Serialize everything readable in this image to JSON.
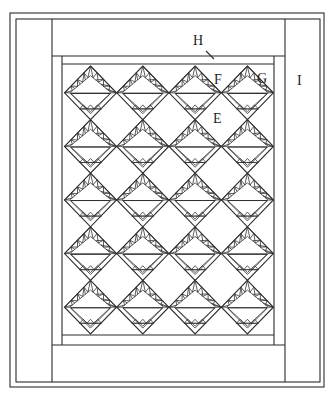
{
  "diagram": {
    "colors": {
      "line": "#2b2b2b",
      "background": "#ffffff"
    },
    "frame": {
      "outer": {
        "x1": 10,
        "y1": 13,
        "x2": 324,
        "y2": 387
      },
      "outer_inner": {
        "x1": 16,
        "y1": 19,
        "x2": 320,
        "y2": 382
      },
      "border_I_left_x": 52,
      "border_I_right_x": 285,
      "border_H_top_bottom_y": 56,
      "border_H_bottom_top_y": 345,
      "inner_frame": {
        "x1": 62,
        "y1": 56,
        "x2": 274,
        "y2": 345
      },
      "block_area": {
        "x1": 62,
        "y1": 64,
        "x2": 274,
        "y2": 335
      }
    },
    "blocks": {
      "name": "basket-block",
      "rows": 5,
      "cols": 4,
      "first_center_x": 90.5,
      "col_spacing": 52.3,
      "first_top_y": 66,
      "row_spacing": 53.6,
      "half_width": 26,
      "half_height": 26.8
    },
    "labels": [
      {
        "id": "H",
        "text": "H",
        "x": 193,
        "y": 34,
        "meaning": "top/bottom border"
      },
      {
        "id": "F",
        "text": "F",
        "x": 214,
        "y": 73,
        "meaning": "setting triangle"
      },
      {
        "id": "G",
        "text": "G",
        "x": 257,
        "y": 72,
        "meaning": "corner triangle"
      },
      {
        "id": "I",
        "text": "I",
        "x": 297,
        "y": 74,
        "meaning": "side border"
      },
      {
        "id": "E",
        "text": "E",
        "x": 213,
        "y": 112,
        "meaning": "setting square"
      }
    ],
    "leader_H": {
      "x1": 206,
      "y1": 51,
      "x2": 214,
      "y2": 59
    }
  }
}
